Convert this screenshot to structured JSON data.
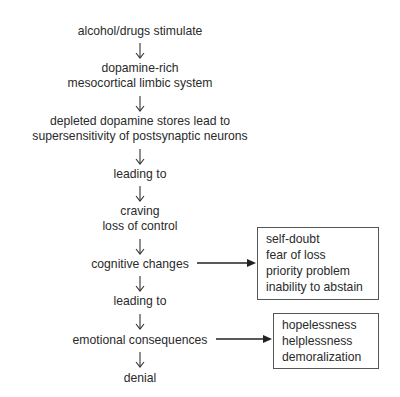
{
  "diagram": {
    "type": "flowchart",
    "steps": [
      {
        "lines": [
          "alcohol/drugs stimulate"
        ]
      },
      {
        "lines": [
          "dopamine-rich",
          "mesocortical limbic system"
        ]
      },
      {
        "lines": [
          "depleted dopamine stores lead to",
          "supersensitivity of postsynaptic neurons"
        ]
      },
      {
        "lines": [
          "leading to"
        ]
      },
      {
        "lines": [
          "craving",
          "loss of control"
        ]
      },
      {
        "lines": [
          "cognitive changes"
        ]
      },
      {
        "lines": [
          "leading to"
        ]
      },
      {
        "lines": [
          "emotional consequences"
        ]
      },
      {
        "lines": [
          "denial"
        ]
      }
    ],
    "side_boxes": {
      "cognitive": {
        "from": "cognitive changes",
        "items": [
          "self-doubt",
          "fear of loss",
          "priority problem",
          "inability to abstain"
        ]
      },
      "emotional": {
        "from": "emotional consequences",
        "items": [
          "hopelessness",
          "helplessness",
          "demoralization"
        ]
      }
    },
    "colors": {
      "text": "#2a2a2a",
      "line": "#333333",
      "background": "#ffffff"
    }
  }
}
